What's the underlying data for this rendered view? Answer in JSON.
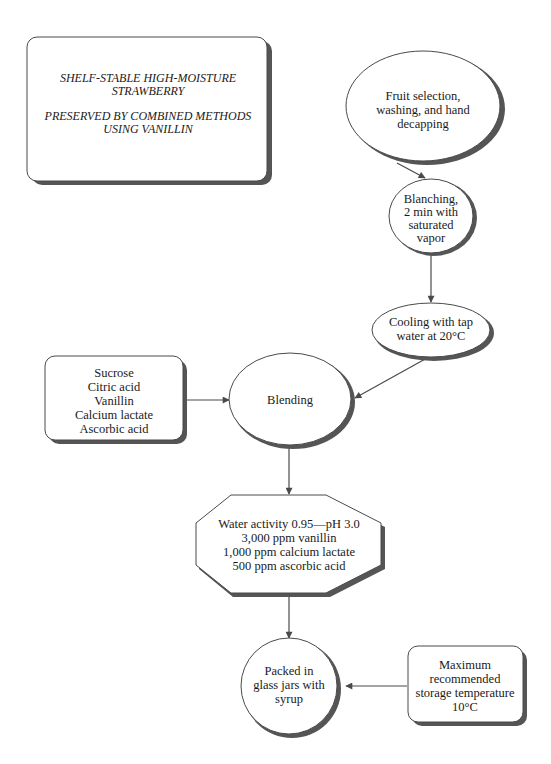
{
  "title": {
    "line1": "SHELF-STABLE HIGH-MOISTURE",
    "line2": "STRAWBERRY",
    "line3": "PRESERVED BY COMBINED METHODS",
    "line4": "USING VANILLIN"
  },
  "nodes": {
    "fruit_selection": {
      "shape": "ellipse",
      "lines": [
        "Fruit selection,",
        "washing, and hand",
        "decapping"
      ]
    },
    "blanching": {
      "shape": "ellipse",
      "lines": [
        "Blanching,",
        "2 min with",
        "saturated",
        "vapor"
      ]
    },
    "cooling": {
      "shape": "ellipse",
      "lines": [
        "Cooling with tap",
        "water at 20°C"
      ]
    },
    "ingredients": {
      "shape": "rounded-rectangle",
      "lines": [
        "Sucrose",
        "Citric acid",
        "Vanillin",
        "Calcium lactate",
        "Ascorbic acid"
      ]
    },
    "blending": {
      "shape": "ellipse",
      "lines": [
        "Blending"
      ]
    },
    "formulation": {
      "shape": "octagon",
      "lines": [
        "Water activity 0.95—pH 3.0",
        "3,000 ppm vanillin",
        "1,000 ppm calcium lactate",
        "500 ppm ascorbic acid"
      ]
    },
    "packed": {
      "shape": "circle",
      "lines": [
        "Packed in",
        "glass jars with",
        "syrup"
      ]
    },
    "storage": {
      "shape": "rounded-rectangle",
      "lines": [
        "Maximum",
        "recommended",
        "storage temperature",
        "10°C"
      ]
    }
  },
  "edges": [
    {
      "from": "fruit_selection",
      "to": "blanching"
    },
    {
      "from": "blanching",
      "to": "cooling"
    },
    {
      "from": "cooling",
      "to": "blending"
    },
    {
      "from": "ingredients",
      "to": "blending"
    },
    {
      "from": "blending",
      "to": "formulation"
    },
    {
      "from": "formulation",
      "to": "packed"
    },
    {
      "from": "storage",
      "to": "packed"
    }
  ],
  "colors": {
    "stroke": "#4a4a4a",
    "shadow": "#555555",
    "fill": "#ffffff",
    "text": "#1a1a1a"
  }
}
